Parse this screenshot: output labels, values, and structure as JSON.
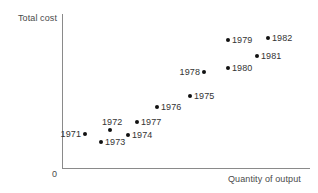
{
  "chart_data": {
    "type": "scatter",
    "title": "",
    "xlabel": "Quantity of output",
    "ylabel": "Total cost",
    "origin_label": "0",
    "grid": false,
    "legend": null,
    "xlim": [
      0,
      100
    ],
    "ylim": [
      0,
      100
    ],
    "axis_ticks": [],
    "note": "Axes are unscaled schematic axes with no numeric tick labels; point values are read as relative positions on the plot area.",
    "points": [
      {
        "label": "1971",
        "x": 9.3,
        "y": 22.1,
        "label_pos": "left",
        "px": 85,
        "py": 134
      },
      {
        "label": "1972",
        "x": 19.4,
        "y": 24.7,
        "label_pos": "above-right",
        "px": 110,
        "py": 130
      },
      {
        "label": "1973",
        "x": 15.7,
        "y": 16.9,
        "label_pos": "right",
        "px": 101,
        "py": 142
      },
      {
        "label": "1974",
        "x": 26.6,
        "y": 21.4,
        "label_pos": "right",
        "px": 128,
        "py": 135
      },
      {
        "label": "1975",
        "x": 51.6,
        "y": 46.8,
        "label_pos": "right",
        "px": 190,
        "py": 96
      },
      {
        "label": "1976",
        "x": 38.3,
        "y": 39.6,
        "label_pos": "right",
        "px": 157,
        "py": 107
      },
      {
        "label": "1977",
        "x": 30.2,
        "y": 30.5,
        "label_pos": "right",
        "px": 137,
        "py": 122
      },
      {
        "label": "1978",
        "x": 57.3,
        "y": 62.3,
        "label_pos": "left",
        "px": 204,
        "py": 72
      },
      {
        "label": "1979",
        "x": 66.9,
        "y": 83.1,
        "label_pos": "right",
        "px": 228,
        "py": 40
      },
      {
        "label": "1980",
        "x": 66.9,
        "y": 64.9,
        "label_pos": "right",
        "px": 228,
        "py": 68
      },
      {
        "label": "1981",
        "x": 78.6,
        "y": 72.7,
        "label_pos": "right",
        "px": 257,
        "py": 56
      },
      {
        "label": "1982",
        "x": 83.1,
        "y": 84.4,
        "label_pos": "right",
        "px": 268,
        "py": 38
      }
    ]
  },
  "colors": {
    "point": "#111111",
    "axis": "#8a8a8a",
    "text": "#333333",
    "background": "#ffffff"
  }
}
